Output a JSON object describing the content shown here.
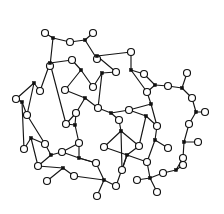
{
  "figure": {
    "background_color": "#ffffff",
    "line_color": "#151515",
    "oxygen_fill": "#ffffff",
    "oxygen_stroke": "#101010",
    "silicon_fill": "#101010",
    "oxygen_radius": 3.5,
    "silicon_halfwidth": 1.6,
    "bond_width": 1.15,
    "canvas": {
      "width": 224,
      "height": 214
    }
  },
  "legend": {
    "oxygen_label": "O",
    "silicon_label": "Si"
  },
  "chart_data": {
    "type": "diagram",
    "node_kinds": [
      "silicon",
      "oxygen"
    ],
    "silicon_nodes": [
      {
        "id": "Si1",
        "x": 53,
        "y": 38
      },
      {
        "id": "Si2",
        "x": 85,
        "y": 40
      },
      {
        "id": "Si3",
        "x": 50,
        "y": 63
      },
      {
        "id": "Si4",
        "x": 97,
        "y": 56
      },
      {
        "id": "Si5",
        "x": 81,
        "y": 70
      },
      {
        "id": "Si6",
        "x": 34,
        "y": 83
      },
      {
        "id": "Si7",
        "x": 102,
        "y": 73
      },
      {
        "id": "Si8",
        "x": 131,
        "y": 70
      },
      {
        "id": "Si9",
        "x": 22,
        "y": 102
      },
      {
        "id": "Si10",
        "x": 155,
        "y": 85
      },
      {
        "id": "Si11",
        "x": 182,
        "y": 88
      },
      {
        "id": "Si12",
        "x": 85,
        "y": 98
      },
      {
        "id": "Si13",
        "x": 151,
        "y": 104
      },
      {
        "id": "Si14",
        "x": 31,
        "y": 138
      },
      {
        "id": "Si15",
        "x": 111,
        "y": 113
      },
      {
        "id": "Si16",
        "x": 196,
        "y": 112
      },
      {
        "id": "Si17",
        "x": 146,
        "y": 116
      },
      {
        "id": "Si18",
        "x": 75,
        "y": 125
      },
      {
        "id": "Si19",
        "x": 121,
        "y": 131
      },
      {
        "id": "Si20",
        "x": 155,
        "y": 140
      },
      {
        "id": "Si21",
        "x": 184,
        "y": 142
      },
      {
        "id": "Si22",
        "x": 51,
        "y": 155
      },
      {
        "id": "Si23",
        "x": 79,
        "y": 158
      },
      {
        "id": "Si24",
        "x": 127,
        "y": 155
      },
      {
        "id": "Si25",
        "x": 104,
        "y": 180
      },
      {
        "id": "Si26",
        "x": 150,
        "y": 178
      },
      {
        "id": "Si27",
        "x": 176,
        "y": 170
      },
      {
        "id": "Si28",
        "x": 63,
        "y": 168
      }
    ],
    "oxygen_nodes": [
      {
        "id": "O1",
        "x": 45,
        "y": 33
      },
      {
        "id": "O2",
        "x": 70,
        "y": 42
      },
      {
        "id": "O3",
        "x": 93,
        "y": 33
      },
      {
        "id": "O4",
        "x": 50,
        "y": 66
      },
      {
        "id": "O5",
        "x": 72,
        "y": 60
      },
      {
        "id": "O6",
        "x": 97,
        "y": 59
      },
      {
        "id": "O7",
        "x": 131,
        "y": 52
      },
      {
        "id": "O8",
        "x": 93,
        "y": 87
      },
      {
        "id": "O9",
        "x": 65,
        "y": 90
      },
      {
        "id": "O10",
        "x": 40,
        "y": 91
      },
      {
        "id": "O11",
        "x": 116,
        "y": 72
      },
      {
        "id": "O12",
        "x": 144,
        "y": 74
      },
      {
        "id": "O13",
        "x": 168,
        "y": 86
      },
      {
        "id": "O14",
        "x": 187,
        "y": 73
      },
      {
        "id": "O15",
        "x": 16,
        "y": 99
      },
      {
        "id": "O16",
        "x": 27,
        "y": 115
      },
      {
        "id": "O17",
        "x": 147,
        "y": 92
      },
      {
        "id": "O18",
        "x": 192,
        "y": 98
      },
      {
        "id": "O19",
        "x": 76,
        "y": 113
      },
      {
        "id": "O20",
        "x": 98,
        "y": 108
      },
      {
        "id": "O21",
        "x": 129,
        "y": 110
      },
      {
        "id": "O22",
        "x": 24,
        "y": 149
      },
      {
        "id": "O23",
        "x": 45,
        "y": 144
      },
      {
        "id": "O24",
        "x": 66,
        "y": 124
      },
      {
        "id": "O25",
        "x": 205,
        "y": 112
      },
      {
        "id": "O26",
        "x": 119,
        "y": 120
      },
      {
        "id": "O27",
        "x": 157,
        "y": 126
      },
      {
        "id": "O28",
        "x": 189,
        "y": 124
      },
      {
        "id": "O29",
        "x": 79,
        "y": 143
      },
      {
        "id": "O30",
        "x": 139,
        "y": 146
      },
      {
        "id": "O31",
        "x": 168,
        "y": 148
      },
      {
        "id": "O32",
        "x": 198,
        "y": 142
      },
      {
        "id": "O33",
        "x": 62,
        "y": 152
      },
      {
        "id": "O34",
        "x": 104,
        "y": 147
      },
      {
        "id": "O35",
        "x": 38,
        "y": 166
      },
      {
        "id": "O36",
        "x": 96,
        "y": 163
      },
      {
        "id": "O37",
        "x": 122,
        "y": 170
      },
      {
        "id": "O38",
        "x": 147,
        "y": 162
      },
      {
        "id": "O39",
        "x": 183,
        "y": 158
      },
      {
        "id": "O40",
        "x": 47,
        "y": 181
      },
      {
        "id": "O41",
        "x": 74,
        "y": 176
      },
      {
        "id": "O42",
        "x": 116,
        "y": 186
      },
      {
        "id": "O43",
        "x": 137,
        "y": 180
      },
      {
        "id": "O44",
        "x": 163,
        "y": 173
      },
      {
        "id": "O45",
        "x": 97,
        "y": 196
      },
      {
        "id": "O46",
        "x": 157,
        "y": 192
      },
      {
        "id": "O47",
        "x": 183,
        "y": 165
      }
    ],
    "bonds": [
      [
        "Si1",
        "O1"
      ],
      [
        "Si1",
        "O2"
      ],
      [
        "Si1",
        "O4"
      ],
      [
        "Si2",
        "O2"
      ],
      [
        "Si2",
        "O3"
      ],
      [
        "Si2",
        "O6"
      ],
      [
        "Si3",
        "O4"
      ],
      [
        "Si3",
        "O10"
      ],
      [
        "Si3",
        "O5"
      ],
      [
        "Si4",
        "O6"
      ],
      [
        "Si4",
        "O7"
      ],
      [
        "Si4",
        "O11"
      ],
      [
        "Si5",
        "O5"
      ],
      [
        "Si5",
        "O9"
      ],
      [
        "Si5",
        "O8"
      ],
      [
        "Si6",
        "O10"
      ],
      [
        "Si6",
        "O15"
      ],
      [
        "Si6",
        "O16"
      ],
      [
        "Si7",
        "O8"
      ],
      [
        "Si7",
        "O11"
      ],
      [
        "Si7",
        "O20"
      ],
      [
        "Si8",
        "O7"
      ],
      [
        "Si8",
        "O12"
      ],
      [
        "Si8",
        "O17"
      ],
      [
        "Si9",
        "O15"
      ],
      [
        "Si9",
        "O16"
      ],
      [
        "Si9",
        "O22"
      ],
      [
        "Si10",
        "O12"
      ],
      [
        "Si10",
        "O13"
      ],
      [
        "Si10",
        "O17"
      ],
      [
        "Si11",
        "O13"
      ],
      [
        "Si11",
        "O14"
      ],
      [
        "Si11",
        "O18"
      ],
      [
        "Si12",
        "O9"
      ],
      [
        "Si12",
        "O19"
      ],
      [
        "Si12",
        "O20"
      ],
      [
        "Si13",
        "O17"
      ],
      [
        "Si13",
        "O21"
      ],
      [
        "Si13",
        "O27"
      ],
      [
        "Si14",
        "O22"
      ],
      [
        "Si14",
        "O23"
      ],
      [
        "Si14",
        "O35"
      ],
      [
        "Si15",
        "O20"
      ],
      [
        "Si15",
        "O21"
      ],
      [
        "Si15",
        "O26"
      ],
      [
        "Si16",
        "O18"
      ],
      [
        "Si16",
        "O25"
      ],
      [
        "Si16",
        "O28"
      ],
      [
        "Si17",
        "O21"
      ],
      [
        "Si17",
        "O27"
      ],
      [
        "Si17",
        "O30"
      ],
      [
        "Si18",
        "O19"
      ],
      [
        "Si18",
        "O24"
      ],
      [
        "Si18",
        "O29"
      ],
      [
        "Si19",
        "O26"
      ],
      [
        "Si19",
        "O30"
      ],
      [
        "Si19",
        "O34"
      ],
      [
        "Si20",
        "O27"
      ],
      [
        "Si20",
        "O31"
      ],
      [
        "Si20",
        "O38"
      ],
      [
        "Si21",
        "O28"
      ],
      [
        "Si21",
        "O32"
      ],
      [
        "Si21",
        "O39"
      ],
      [
        "Si22",
        "O23"
      ],
      [
        "Si22",
        "O33"
      ],
      [
        "Si22",
        "O35"
      ],
      [
        "Si23",
        "O29"
      ],
      [
        "Si23",
        "O33"
      ],
      [
        "Si23",
        "O36"
      ],
      [
        "Si24",
        "O34"
      ],
      [
        "Si24",
        "O37"
      ],
      [
        "Si24",
        "O38"
      ],
      [
        "Si25",
        "O42"
      ],
      [
        "Si25",
        "O41"
      ],
      [
        "Si25",
        "O45"
      ],
      [
        "Si26",
        "O43"
      ],
      [
        "Si26",
        "O46"
      ],
      [
        "Si26",
        "O44"
      ],
      [
        "Si27",
        "O44"
      ],
      [
        "Si27",
        "O39"
      ],
      [
        "Si27",
        "O47"
      ],
      [
        "Si28",
        "O35"
      ],
      [
        "Si28",
        "O40"
      ],
      [
        "Si28",
        "O41"
      ],
      [
        "Si24",
        "O30"
      ],
      [
        "Si19",
        "O37"
      ],
      [
        "Si26",
        "O38"
      ],
      [
        "O36",
        "Si23"
      ],
      [
        "O36",
        "Si25"
      ],
      [
        "O42",
        "Si24"
      ],
      [
        "O24",
        "Si3"
      ],
      [
        "O19",
        "O24"
      ],
      [
        "O33",
        "O29"
      ],
      [
        "O16",
        "O23"
      ]
    ],
    "counts": {
      "silicon": 28,
      "oxygen": 47,
      "bonds": 94
    }
  }
}
